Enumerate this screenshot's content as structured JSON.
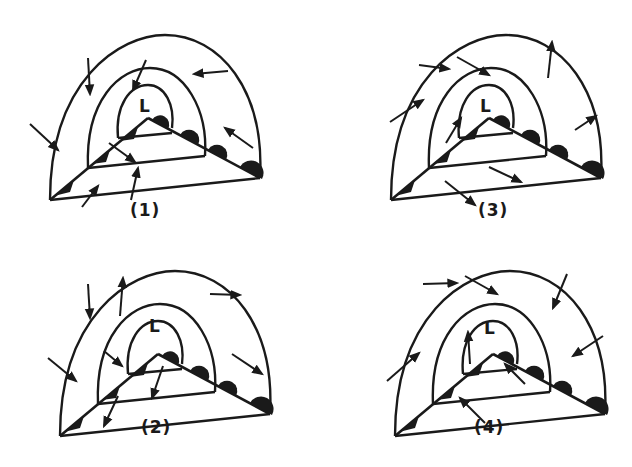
{
  "figure": {
    "panels": [
      {
        "id": "1",
        "label": "(1)",
        "center_label": "L"
      },
      {
        "id": "2",
        "label": "(2)",
        "center_label": "L"
      },
      {
        "id": "3",
        "label": "(3)",
        "center_label": "L"
      },
      {
        "id": "4",
        "label": "(4)",
        "center_label": "L"
      }
    ]
  },
  "colors": {
    "ink": "#1a1a1a",
    "background": "#ffffff"
  }
}
